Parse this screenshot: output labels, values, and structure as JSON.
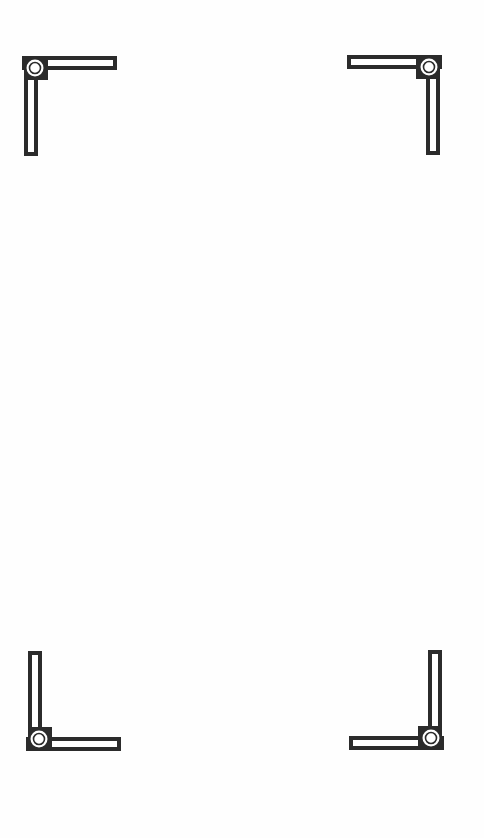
{
  "page": {
    "background": "#fefefe",
    "ink_color": "#2b2b2b"
  },
  "frame": {
    "corners": [
      {
        "position": "top-left",
        "icon": "corner-bracket-icon"
      },
      {
        "position": "top-right",
        "icon": "corner-bracket-icon"
      },
      {
        "position": "bottom-left",
        "icon": "corner-bracket-icon"
      },
      {
        "position": "bottom-right",
        "icon": "corner-bracket-icon"
      }
    ]
  }
}
